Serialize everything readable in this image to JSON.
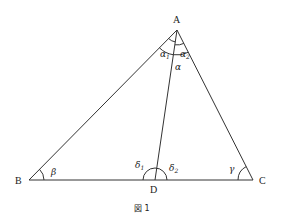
{
  "figure": {
    "caption": "図 1",
    "vertices": {
      "A": {
        "label": "A",
        "x": 177,
        "y": 30
      },
      "B": {
        "label": "B",
        "x": 29,
        "y": 180
      },
      "C": {
        "label": "C",
        "x": 253,
        "y": 180
      },
      "D": {
        "label": "D",
        "x": 155,
        "y": 180
      }
    },
    "angles": {
      "alpha": "α",
      "alpha1": "α",
      "alpha1_sub": "1",
      "alpha2": "α",
      "alpha2_sub": "2",
      "beta": "β",
      "gamma": "γ",
      "delta1": "δ",
      "delta1_sub": "1",
      "delta2": "δ",
      "delta2_sub": "2"
    },
    "colors": {
      "line": "#333333",
      "text": "#222222",
      "background": "#ffffff"
    }
  }
}
